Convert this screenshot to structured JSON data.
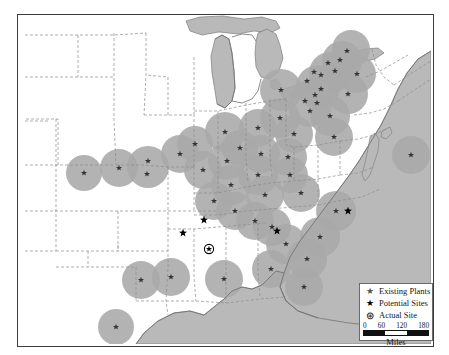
{
  "map": {
    "title": "",
    "colors": {
      "buffer_fill": "#a9a9a9",
      "water_fill": "#b9b9b9",
      "land_fill": "#ffffff",
      "state_border": "#8d8d8d",
      "coast_border": "#6e6e6e",
      "frame_border": "#3c3c3c",
      "marker_dark": "#333333",
      "marker_black": "#000000"
    },
    "water_bodies": [
      "Lake Superior",
      "Lake Michigan",
      "Lake Huron",
      "Lake Erie",
      "Lake Ontario",
      "Gulf of Mexico",
      "Atlantic Ocean"
    ]
  },
  "legend": {
    "title": "",
    "items": [
      {
        "symbol": "★",
        "symbol_name": "gray-star-icon",
        "label": "Existing Plants",
        "color": "#555555"
      },
      {
        "symbol": "★",
        "symbol_name": "black-star-icon",
        "label": "Potential Sites",
        "color": "#000000"
      },
      {
        "symbol": "⊛",
        "symbol_name": "circled-star-icon",
        "label": "Actual Site",
        "color": "#000000"
      }
    ],
    "scale": {
      "ticks": [
        "0",
        "60",
        "120",
        "180"
      ],
      "unit": "Miles",
      "segments": [
        "#111111",
        "#ffffff",
        "#111111"
      ]
    }
  },
  "markers": {
    "existing_plants": [
      {
        "x": 101,
        "y": 153
      },
      {
        "x": 130,
        "y": 146
      },
      {
        "x": 129,
        "y": 159
      },
      {
        "x": 162,
        "y": 139
      },
      {
        "x": 185,
        "y": 155
      },
      {
        "x": 177,
        "y": 129
      },
      {
        "x": 207,
        "y": 117
      },
      {
        "x": 209,
        "y": 146
      },
      {
        "x": 222,
        "y": 133
      },
      {
        "x": 213,
        "y": 170
      },
      {
        "x": 196,
        "y": 186
      },
      {
        "x": 217,
        "y": 196
      },
      {
        "x": 240,
        "y": 160
      },
      {
        "x": 247,
        "y": 180
      },
      {
        "x": 237,
        "y": 206
      },
      {
        "x": 243,
        "y": 139
      },
      {
        "x": 263,
        "y": 75
      },
      {
        "x": 262,
        "y": 103
      },
      {
        "x": 276,
        "y": 119
      },
      {
        "x": 270,
        "y": 142
      },
      {
        "x": 272,
        "y": 160
      },
      {
        "x": 283,
        "y": 178
      },
      {
        "x": 287,
        "y": 86
      },
      {
        "x": 292,
        "y": 96
      },
      {
        "x": 297,
        "y": 80
      },
      {
        "x": 299,
        "y": 88
      },
      {
        "x": 303,
        "y": 74
      },
      {
        "x": 289,
        "y": 66
      },
      {
        "x": 296,
        "y": 57
      },
      {
        "x": 303,
        "y": 60
      },
      {
        "x": 310,
        "y": 48
      },
      {
        "x": 317,
        "y": 56
      },
      {
        "x": 322,
        "y": 45
      },
      {
        "x": 329,
        "y": 36
      },
      {
        "x": 312,
        "y": 101
      },
      {
        "x": 316,
        "y": 122
      },
      {
        "x": 330,
        "y": 79
      },
      {
        "x": 339,
        "y": 59
      },
      {
        "x": 393,
        "y": 140
      },
      {
        "x": 318,
        "y": 196
      },
      {
        "x": 302,
        "y": 222
      },
      {
        "x": 268,
        "y": 229
      },
      {
        "x": 289,
        "y": 244
      },
      {
        "x": 253,
        "y": 254
      },
      {
        "x": 286,
        "y": 272
      },
      {
        "x": 206,
        "y": 264
      },
      {
        "x": 123,
        "y": 265
      },
      {
        "x": 153,
        "y": 262
      },
      {
        "x": 98,
        "y": 312
      },
      {
        "x": 66,
        "y": 158
      },
      {
        "x": 240,
        "y": 113
      },
      {
        "x": 254,
        "y": 212
      }
    ],
    "potential_sites": [
      {
        "x": 186,
        "y": 205
      },
      {
        "x": 165,
        "y": 218
      },
      {
        "x": 259,
        "y": 216
      },
      {
        "x": 330,
        "y": 196
      }
    ],
    "actual_site": {
      "x": 191,
      "y": 234
    }
  }
}
